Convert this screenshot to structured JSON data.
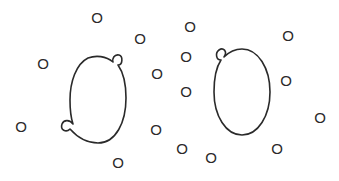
{
  "diagram": {
    "width": 339,
    "height": 181,
    "background": "#ffffff",
    "stroke_color": "#2a2a2a",
    "cells": [
      {
        "id": "left-cell",
        "cx": 98,
        "cy": 99,
        "rx": 28,
        "ry": 44,
        "buds": [
          {
            "position": "upper-right",
            "x": 118,
            "y": 58
          },
          {
            "position": "lower-left",
            "x": 66,
            "y": 126
          }
        ]
      },
      {
        "id": "right-cell",
        "cx": 242,
        "cy": 92,
        "rx": 28,
        "ry": 43,
        "buds": [
          {
            "position": "upper-left",
            "x": 220,
            "y": 54
          }
        ]
      }
    ],
    "labels": [
      {
        "text": "O",
        "x": 97,
        "y": 17
      },
      {
        "text": "O",
        "x": 140,
        "y": 38
      },
      {
        "text": "O",
        "x": 190,
        "y": 26
      },
      {
        "text": "O",
        "x": 43,
        "y": 63
      },
      {
        "text": "O",
        "x": 186,
        "y": 56
      },
      {
        "text": "O",
        "x": 157,
        "y": 73
      },
      {
        "text": "O",
        "x": 186,
        "y": 91
      },
      {
        "text": "O",
        "x": 288,
        "y": 35
      },
      {
        "text": "O",
        "x": 286,
        "y": 80
      },
      {
        "text": "O",
        "x": 320,
        "y": 117
      },
      {
        "text": "O",
        "x": 21,
        "y": 126
      },
      {
        "text": "O",
        "x": 156,
        "y": 129
      },
      {
        "text": "O",
        "x": 182,
        "y": 148
      },
      {
        "text": "O",
        "x": 211,
        "y": 157
      },
      {
        "text": "O",
        "x": 277,
        "y": 148
      },
      {
        "text": "O",
        "x": 118,
        "y": 162
      }
    ]
  }
}
